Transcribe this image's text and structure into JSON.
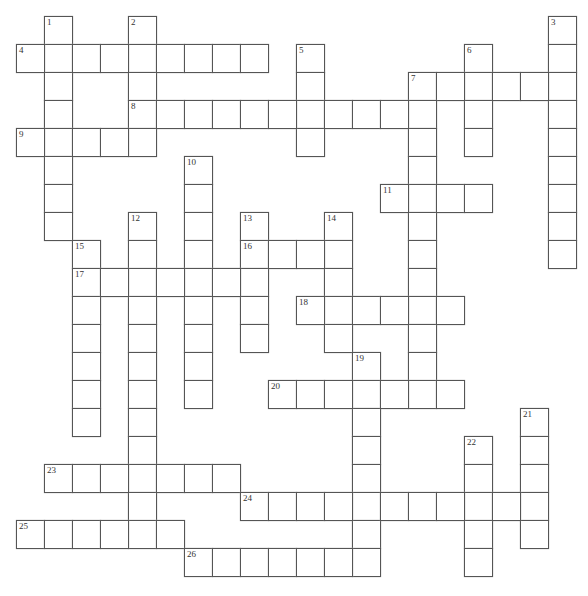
{
  "puzzle": {
    "type": "crossword",
    "cell_size": 28,
    "origin": {
      "x": 16,
      "y": 16
    },
    "colors": {
      "border": "#555555",
      "cell_bg": "#ffffff",
      "number": "#333333"
    },
    "entries": [
      {
        "number": "1",
        "direction": "down",
        "col": 1,
        "row": 0,
        "length": 8
      },
      {
        "number": "2",
        "direction": "down",
        "col": 4,
        "row": 0,
        "length": 5
      },
      {
        "number": "3",
        "direction": "down",
        "col": 19,
        "row": 0,
        "length": 9
      },
      {
        "number": "4",
        "direction": "across",
        "col": 0,
        "row": 1,
        "length": 9
      },
      {
        "number": "5",
        "direction": "down",
        "col": 10,
        "row": 1,
        "length": 4
      },
      {
        "number": "6",
        "direction": "down",
        "col": 16,
        "row": 1,
        "length": 4
      },
      {
        "number": "7",
        "direction": "across",
        "col": 14,
        "row": 2,
        "length": 6
      },
      {
        "number": "7",
        "direction": "down",
        "col": 14,
        "row": 2,
        "length": 12
      },
      {
        "number": "8",
        "direction": "across",
        "col": 4,
        "row": 3,
        "length": 11
      },
      {
        "number": "9",
        "direction": "across",
        "col": 0,
        "row": 4,
        "length": 5
      },
      {
        "number": "10",
        "direction": "down",
        "col": 6,
        "row": 5,
        "length": 9
      },
      {
        "number": "11",
        "direction": "across",
        "col": 13,
        "row": 6,
        "length": 4
      },
      {
        "number": "12",
        "direction": "down",
        "col": 4,
        "row": 7,
        "length": 12
      },
      {
        "number": "13",
        "direction": "down",
        "col": 8,
        "row": 7,
        "length": 5
      },
      {
        "number": "14",
        "direction": "down",
        "col": 11,
        "row": 7,
        "length": 5
      },
      {
        "number": "15",
        "direction": "down",
        "col": 2,
        "row": 8,
        "length": 7
      },
      {
        "number": "16",
        "direction": "across",
        "col": 8,
        "row": 8,
        "length": 4
      },
      {
        "number": "17",
        "direction": "across",
        "col": 2,
        "row": 9,
        "length": 7
      },
      {
        "number": "18",
        "direction": "across",
        "col": 10,
        "row": 10,
        "length": 6
      },
      {
        "number": "19",
        "direction": "down",
        "col": 12,
        "row": 12,
        "length": 8
      },
      {
        "number": "20",
        "direction": "across",
        "col": 9,
        "row": 13,
        "length": 7
      },
      {
        "number": "21",
        "direction": "down",
        "col": 18,
        "row": 14,
        "length": 5
      },
      {
        "number": "22",
        "direction": "down",
        "col": 16,
        "row": 15,
        "length": 5
      },
      {
        "number": "23",
        "direction": "across",
        "col": 1,
        "row": 16,
        "length": 7
      },
      {
        "number": "24",
        "direction": "across",
        "col": 8,
        "row": 17,
        "length": 11
      },
      {
        "number": "25",
        "direction": "across",
        "col": 0,
        "row": 18,
        "length": 6
      },
      {
        "number": "26",
        "direction": "across",
        "col": 6,
        "row": 19,
        "length": 7
      }
    ]
  }
}
